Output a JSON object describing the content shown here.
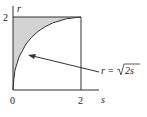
{
  "diagram": {
    "axes": {
      "x_label": "s",
      "y_label": "r",
      "x_ticks": [
        "0",
        "2"
      ],
      "y_ticks": [
        "2"
      ]
    },
    "curve": {
      "label_lhs": "r",
      "label_eq": "=",
      "label_rhs": "2s",
      "equation": "r = √(2s)"
    },
    "region": {
      "description": "Shaded region between r-axis and curve r = √(2s), 0 ≤ r ≤ 2",
      "fill_color": "#d3d3d3"
    },
    "line_color": "#333333"
  }
}
